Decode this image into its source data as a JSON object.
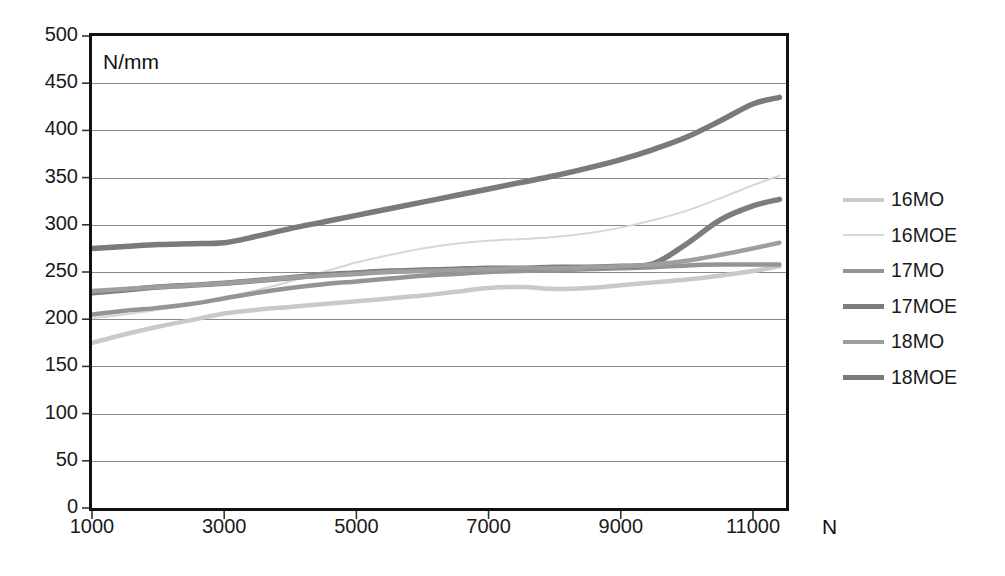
{
  "chart_data": {
    "type": "line",
    "title": "",
    "subtitle": "",
    "xlabel": "N",
    "ylabel": "N/mm",
    "unit_annotation": "N/mm",
    "xlim": [
      1000,
      11500
    ],
    "ylim": [
      0,
      500
    ],
    "grid": true,
    "legend_position": "right",
    "y_ticks": [
      0,
      50,
      100,
      150,
      200,
      250,
      300,
      350,
      400,
      450,
      500
    ],
    "y_tick_labels": [
      "0",
      "50",
      "100",
      "150",
      "200",
      "250",
      "300",
      "350",
      "400",
      "450",
      "500"
    ],
    "x_ticks": [
      1000,
      3000,
      5000,
      7000,
      9000,
      11000
    ],
    "x_tick_labels": [
      "1000",
      "3000",
      "5000",
      "7000",
      "9000",
      "11000"
    ],
    "x": [
      1000,
      1500,
      2000,
      2500,
      3000,
      3500,
      4000,
      4500,
      5000,
      5500,
      6000,
      6500,
      7000,
      7500,
      8000,
      8500,
      9000,
      9500,
      10000,
      10500,
      11000,
      11400
    ],
    "series": [
      {
        "name": "16MO",
        "color": "#c9c9c9",
        "width": 4.5,
        "values": [
          175,
          184,
          192,
          199,
          206,
          210,
          213,
          216,
          219,
          222,
          225,
          229,
          233,
          234,
          232,
          233,
          236,
          239,
          242,
          246,
          251,
          256
        ]
      },
      {
        "name": "16MOE",
        "color": "#d7d7d7",
        "width": 2.0,
        "values": [
          201,
          205,
          210,
          216,
          223,
          231,
          240,
          250,
          260,
          268,
          275,
          280,
          283,
          285,
          287,
          291,
          297,
          305,
          315,
          328,
          342,
          352
        ]
      },
      {
        "name": "17MO",
        "color": "#949494",
        "width": 4.5,
        "values": [
          205,
          209,
          212,
          216,
          222,
          228,
          233,
          237,
          240,
          243,
          246,
          248,
          250,
          251,
          252,
          253,
          254,
          255,
          257,
          258,
          258,
          258
        ]
      },
      {
        "name": "17MOE",
        "color": "#7d7d7d",
        "width": 5.5,
        "values": [
          228,
          231,
          234,
          236,
          238,
          241,
          244,
          247,
          249,
          251,
          252,
          253,
          254,
          254,
          255,
          255,
          256,
          259,
          280,
          305,
          320,
          327
        ]
      },
      {
        "name": "18MO",
        "color": "#9e9e9e",
        "width": 4.5,
        "values": [
          230,
          232,
          234,
          236,
          238,
          241,
          244,
          246,
          248,
          250,
          251,
          252,
          253,
          254,
          254,
          255,
          256,
          258,
          262,
          268,
          275,
          281
        ]
      },
      {
        "name": "18MOE",
        "color": "#7a7a7a",
        "width": 5.5,
        "values": [
          275,
          277,
          279,
          280,
          281,
          288,
          296,
          303,
          310,
          317,
          324,
          331,
          338,
          345,
          352,
          360,
          369,
          380,
          393,
          410,
          428,
          435
        ]
      }
    ]
  },
  "legend": {
    "items": [
      {
        "label": "16MO"
      },
      {
        "label": "16MOE"
      },
      {
        "label": "17MO"
      },
      {
        "label": "17MOE"
      },
      {
        "label": "18MO"
      },
      {
        "label": "18MOE"
      }
    ]
  }
}
